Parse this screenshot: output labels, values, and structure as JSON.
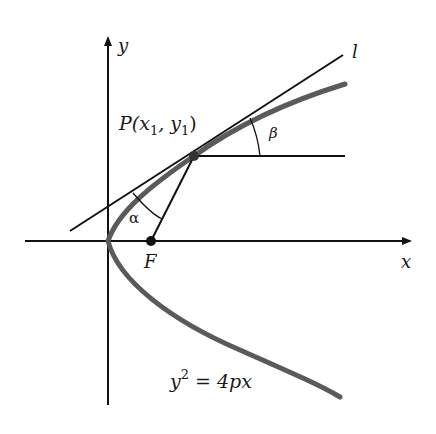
{
  "figure": {
    "labels": {
      "y_axis": "y",
      "x_axis": "x",
      "tangent_line": "l",
      "point": "P(x",
      "point_sub1": "1",
      "point_mid": ", y",
      "point_sub2": "1",
      "point_close": ")",
      "focus": "F",
      "alpha": "α",
      "beta": "β",
      "equation_base": "y",
      "equation_exp": "2",
      "equation_rest": " = 4px"
    },
    "colors": {
      "axes": "#111111",
      "parabola": "#555555",
      "lines": "#111111",
      "background": "#ffffff"
    }
  }
}
